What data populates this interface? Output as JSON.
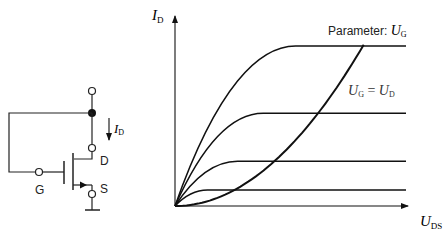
{
  "circuit": {
    "terminal_drain": "D",
    "terminal_gate": "G",
    "terminal_source": "S",
    "current_symbol": "I",
    "current_subscript": "D"
  },
  "plot": {
    "y_axis_symbol": "I",
    "y_axis_subscript": "D",
    "x_axis_symbol": "U",
    "x_axis_subscript": "DS",
    "parameter_label_text": "Parameter: ",
    "parameter_symbol": "U",
    "parameter_subscript": "G",
    "boundary_label": {
      "lhs_symbol": "U",
      "lhs_subscript": "G",
      "equals": " = ",
      "rhs_symbol": "U",
      "rhs_subscript": "D"
    }
  },
  "chart_data": {
    "type": "line",
    "xlabel": "U_DS",
    "ylabel": "I_D",
    "xlim": [
      0,
      1
    ],
    "ylim": [
      0,
      1
    ],
    "parameter": "U_G",
    "series": [
      {
        "name": "U_G level 1",
        "saturation_start_x": 0.14,
        "saturation_current": 0.1
      },
      {
        "name": "U_G level 2",
        "saturation_start_x": 0.27,
        "saturation_current": 0.28
      },
      {
        "name": "U_G level 3",
        "saturation_start_x": 0.38,
        "saturation_current": 0.58
      },
      {
        "name": "U_G level 4",
        "saturation_start_x": 0.52,
        "saturation_current": 1.0
      },
      {
        "name": "U_G = U_D",
        "type": "parabola",
        "points": [
          [
            0,
            0
          ],
          [
            0.32,
            0.1
          ],
          [
            0.49,
            0.28
          ],
          [
            0.67,
            0.58
          ],
          [
            0.81,
            1.0
          ]
        ]
      }
    ]
  }
}
